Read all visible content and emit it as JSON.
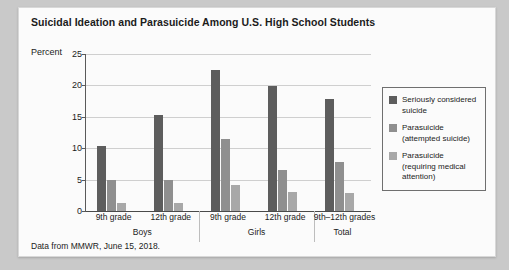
{
  "figure": {
    "title": "Suicidal Ideation and Parasuicide Among U.S. High School Students",
    "axis_title": "Percent",
    "source_note": "Data from MMWR, June 15, 2018."
  },
  "legend": {
    "items": [
      {
        "label": "Seriously considered suicide",
        "color": "#5d5d5d",
        "swatch_name": "legend-swatch-considered"
      },
      {
        "label": "Parasuicide (attempted suicide)",
        "color": "#8f8f8f",
        "swatch_name": "legend-swatch-attempted"
      },
      {
        "label": "Parasuicide (requiring medical attention)",
        "color": "#a8a8a8",
        "swatch_name": "legend-swatch-medical"
      }
    ]
  },
  "groups": [
    {
      "name": "Boys",
      "categories": [
        "9th grade",
        "12th grade"
      ]
    },
    {
      "name": "Girls",
      "categories": [
        "9th grade",
        "12th grade"
      ]
    },
    {
      "name": "Total",
      "categories": [
        "9th–12th grades"
      ]
    }
  ],
  "chart_data": {
    "type": "bar",
    "title": "Suicidal Ideation and Parasuicide Among U.S. High School Students",
    "xlabel": "",
    "ylabel": "Percent",
    "ylim": [
      0,
      25
    ],
    "yticks": [
      0,
      5,
      10,
      15,
      20,
      25
    ],
    "grid": true,
    "legend_position": "right",
    "categories": [
      "Boys 9th grade",
      "Boys 12th grade",
      "Girls 9th grade",
      "Girls 12th grade",
      "Total 9th–12th grades"
    ],
    "group_labels": [
      "Boys",
      "Girls",
      "Total"
    ],
    "series": [
      {
        "name": "Seriously considered suicide",
        "color": "#5d5d5d",
        "values": [
          10.3,
          15.3,
          22.4,
          19.9,
          17.8
        ]
      },
      {
        "name": "Parasuicide (attempted suicide)",
        "color": "#8f8f8f",
        "values": [
          5.0,
          5.0,
          11.5,
          6.6,
          7.8
        ]
      },
      {
        "name": "Parasuicide (requiring medical attention)",
        "color": "#a8a8a8",
        "values": [
          1.3,
          1.2,
          4.1,
          3.1,
          2.9
        ]
      }
    ],
    "annotation": "Data from MMWR, June 15, 2018."
  }
}
